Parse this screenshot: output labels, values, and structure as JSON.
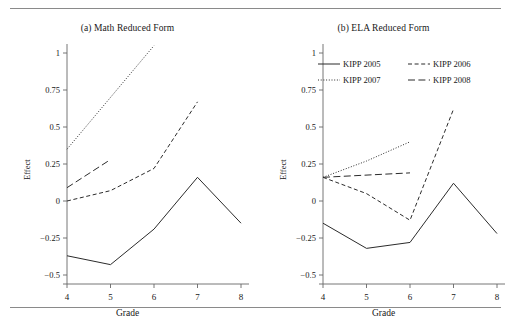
{
  "figure": {
    "top_rule": true,
    "bottom_rule": true,
    "axis_color": "#666666",
    "line_color": "#2b2b2b"
  },
  "chart_data": [
    {
      "type": "line",
      "panel_id": "a",
      "title": "(a) Math Reduced Form",
      "xlabel": "Grade",
      "ylabel": "Effect",
      "x": [
        4,
        5,
        6,
        7,
        8
      ],
      "xticks": [
        "4",
        "5",
        "6",
        "7",
        "8"
      ],
      "xlim": [
        3.7,
        8.3
      ],
      "yticks": [
        "1",
        "0.75",
        "0.5",
        "0.25",
        "0",
        "−0.25",
        "−0.5"
      ],
      "ytickvalues": [
        1,
        0.75,
        0.5,
        0.25,
        0,
        -0.25,
        -0.5
      ],
      "ylim": [
        -0.58,
        1.1
      ],
      "grid": false,
      "legend": "none",
      "series": [
        {
          "name": "KIPP 2005",
          "style": "solid",
          "x": [
            4,
            5,
            6,
            7,
            8
          ],
          "values": [
            -0.37,
            -0.43,
            -0.19,
            0.16,
            -0.15
          ]
        },
        {
          "name": "KIPP 2006",
          "style": "dashed",
          "x": [
            4,
            5,
            6,
            7
          ],
          "values": [
            0.0,
            0.07,
            0.22,
            0.67
          ]
        },
        {
          "name": "KIPP 2007",
          "style": "dotted",
          "x": [
            4,
            6
          ],
          "values": [
            0.35,
            1.05
          ]
        },
        {
          "name": "KIPP 2008",
          "style": "longdash",
          "x": [
            4,
            5
          ],
          "values": [
            0.09,
            0.28
          ]
        }
      ]
    },
    {
      "type": "line",
      "panel_id": "b",
      "title": "(b) ELA Reduced Form",
      "xlabel": "Grade",
      "ylabel": "Effect",
      "x": [
        4,
        5,
        6,
        7,
        8
      ],
      "xticks": [
        "4",
        "5",
        "6",
        "7",
        "8"
      ],
      "xlim": [
        3.7,
        8.3
      ],
      "yticks": [
        "1",
        "0.75",
        "0.5",
        "0.25",
        "0",
        "−0.25",
        "−0.5"
      ],
      "ytickvalues": [
        1,
        0.75,
        0.5,
        0.25,
        0,
        -0.25,
        -0.5
      ],
      "ylim": [
        -0.58,
        1.1
      ],
      "grid": false,
      "legend": "upper-center",
      "legend_entries": [
        {
          "label": "KIPP 2005",
          "style": "solid"
        },
        {
          "label": "KIPP 2006",
          "style": "dashed"
        },
        {
          "label": "KIPP 2007",
          "style": "dotted"
        },
        {
          "label": "KIPP 2008",
          "style": "longdash"
        }
      ],
      "series": [
        {
          "name": "KIPP 2005",
          "style": "solid",
          "x": [
            4,
            5,
            6,
            7,
            8
          ],
          "values": [
            -0.15,
            -0.32,
            -0.28,
            0.12,
            -0.22
          ]
        },
        {
          "name": "KIPP 2006",
          "style": "dashed",
          "x": [
            4,
            5,
            6,
            7
          ],
          "values": [
            0.16,
            0.05,
            -0.13,
            0.62
          ]
        },
        {
          "name": "KIPP 2007",
          "style": "dotted",
          "x": [
            4,
            5,
            6
          ],
          "values": [
            0.16,
            0.27,
            0.4
          ]
        },
        {
          "name": "KIPP 2008",
          "style": "longdash",
          "x": [
            4,
            6
          ],
          "values": [
            0.16,
            0.19
          ]
        }
      ]
    }
  ]
}
